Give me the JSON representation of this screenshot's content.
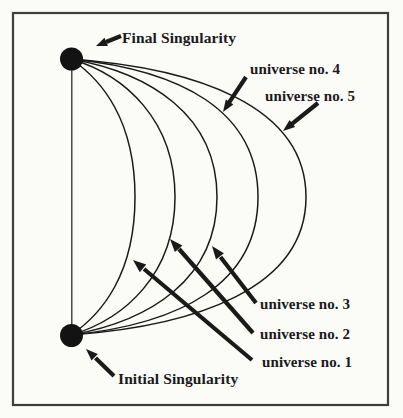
{
  "diagram": {
    "final_singularity_label": "Final Singularity",
    "initial_singularity_label": "Initial Singularity",
    "universes": [
      {
        "label": "universe no. 1"
      },
      {
        "label": "universe no. 2"
      },
      {
        "label": "universe no. 3"
      },
      {
        "label": "universe no. 4"
      },
      {
        "label": "universe no. 5"
      }
    ]
  },
  "colors": {
    "ink": "#1a1a1a",
    "frame": "#3e3e3e",
    "paper": "#fbfbf8",
    "dot": "#131313"
  }
}
